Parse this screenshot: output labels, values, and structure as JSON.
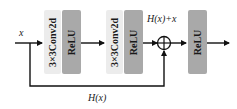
{
  "diagram": {
    "type": "residual-block",
    "input_label": "x",
    "skip_label": "H(x)",
    "sum_label": "H(x)+x",
    "blocks": [
      {
        "id": "conv1",
        "label": "3×3Conv2d",
        "kind": "conv",
        "color": "#ececec"
      },
      {
        "id": "relu1",
        "label": "ReLU",
        "kind": "activation",
        "color": "#a9a9a9"
      },
      {
        "id": "conv2",
        "label": "3×3Conv2d",
        "kind": "conv",
        "color": "#ececec"
      },
      {
        "id": "relu2",
        "label": "ReLU",
        "kind": "activation",
        "color": "#a9a9a9"
      },
      {
        "id": "relu3",
        "label": "ReLU",
        "kind": "activation",
        "color": "#a9a9a9"
      }
    ],
    "sum_node": "⊕",
    "edges": [
      {
        "from": "x",
        "to": "conv1"
      },
      {
        "from": "relu1",
        "to": "conv2"
      },
      {
        "from": "relu2",
        "to": "sum"
      },
      {
        "from": "x",
        "to": "sum",
        "style": "skip"
      },
      {
        "from": "sum",
        "to": "relu3"
      },
      {
        "from": "relu3",
        "to": "output"
      }
    ]
  }
}
